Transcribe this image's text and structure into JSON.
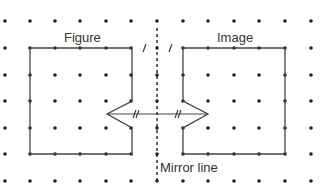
{
  "labels": {
    "figure": "Figure",
    "image": "Image",
    "mirror_line": "Mirror line"
  },
  "grid": {
    "cols_x": [
      5,
      30,
      55,
      80,
      106,
      131,
      157,
      183,
      208,
      234,
      259,
      285,
      311
    ],
    "rows_y": [
      21,
      48,
      75,
      101,
      128,
      154,
      181
    ],
    "dot_color": "#222222"
  },
  "shapes": {
    "figure_points": "30,48 132,48 132,101 107,114 132,128 132,154 30,154",
    "image_points": "183,48 285,48 285,154 183,154 183,128 208,114 183,101",
    "line_color": "#444444"
  },
  "mirror": {
    "x": 157,
    "y1": 28,
    "y2": 184
  }
}
